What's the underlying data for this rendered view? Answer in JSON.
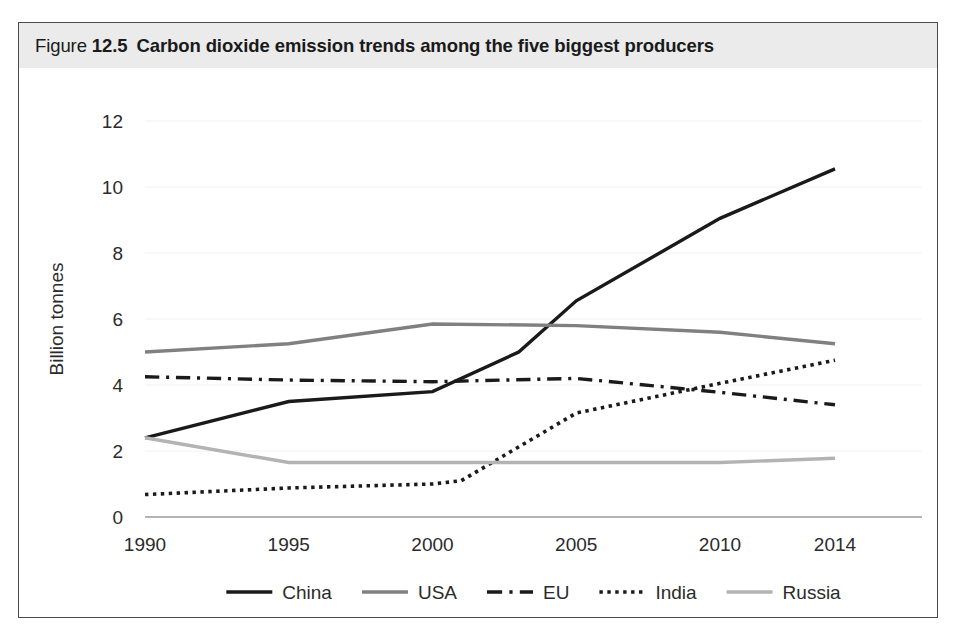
{
  "figure": {
    "label_word": "Figure",
    "number": "12.5",
    "caption": "Carbon dioxide emission trends among the five biggest producers"
  },
  "chart_data": {
    "type": "line",
    "title": "Carbon dioxide emission trends among the five biggest producers",
    "xlabel": "",
    "ylabel": "Billion tonnes",
    "x": [
      1990,
      1995,
      2000,
      2005,
      2010,
      2014
    ],
    "xtick_labels": [
      "1990",
      "1995",
      "2000",
      "2005",
      "2010",
      "2014"
    ],
    "ytick_labels": [
      "0",
      "2",
      "4",
      "6",
      "8",
      "10",
      "12"
    ],
    "yticks": [
      0,
      2,
      4,
      6,
      8,
      10,
      12
    ],
    "ylim": [
      0,
      12.6
    ],
    "xlim": [
      1990,
      2014
    ],
    "grid": true,
    "legend_position": "bottom",
    "series": [
      {
        "name": "China",
        "style": "solid",
        "color": "#1a1a1a",
        "width": 3.4,
        "x": [
          1990,
          1995,
          2000,
          2003,
          2005,
          2010,
          2014
        ],
        "values": [
          2.4,
          3.5,
          3.8,
          5.0,
          6.55,
          9.05,
          10.55
        ]
      },
      {
        "name": "USA",
        "style": "solid",
        "color": "#808080",
        "width": 3.4,
        "x": [
          1990,
          1995,
          2000,
          2005,
          2010,
          2014
        ],
        "values": [
          5.0,
          5.25,
          5.85,
          5.8,
          5.6,
          5.25
        ]
      },
      {
        "name": "EU",
        "style": "dashdot",
        "color": "#1a1a1a",
        "width": 3.4,
        "x": [
          1990,
          1995,
          2000,
          2005,
          2010,
          2014
        ],
        "values": [
          4.25,
          4.15,
          4.1,
          4.2,
          3.78,
          3.4
        ]
      },
      {
        "name": "India",
        "style": "dotted",
        "color": "#1a1a1a",
        "width": 3.6,
        "x": [
          1990,
          1995,
          2000,
          2001,
          2005,
          2010,
          2014
        ],
        "values": [
          0.68,
          0.88,
          1.0,
          1.1,
          3.15,
          4.05,
          4.75
        ]
      },
      {
        "name": "Russia",
        "style": "solid",
        "color": "#b3b3b3",
        "width": 3.4,
        "x": [
          1990,
          1995,
          2000,
          2005,
          2010,
          2014
        ],
        "values": [
          2.4,
          1.65,
          1.65,
          1.65,
          1.65,
          1.78
        ]
      }
    ],
    "legend": [
      {
        "label": "China",
        "style": "solid",
        "color": "#1a1a1a"
      },
      {
        "label": "USA",
        "style": "solid",
        "color": "#808080"
      },
      {
        "label": "EU",
        "style": "dashdot",
        "color": "#1a1a1a"
      },
      {
        "label": "India",
        "style": "dotted",
        "color": "#1a1a1a"
      },
      {
        "label": "Russia",
        "style": "solid",
        "color": "#b3b3b3"
      }
    ]
  }
}
